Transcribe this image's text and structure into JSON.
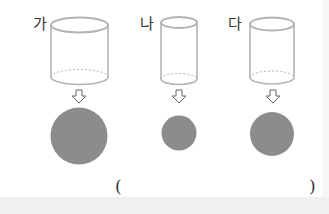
{
  "labels": {
    "a": "가",
    "b": "나",
    "c": "다"
  },
  "answer": {
    "open_paren": "(",
    "close_paren": ")"
  },
  "colors": {
    "circle_fill": "#8c8c8c",
    "cylinder_stroke": "#b0b0b0",
    "strip": "#f0f0f0"
  }
}
